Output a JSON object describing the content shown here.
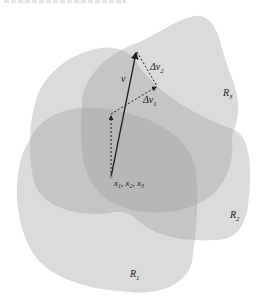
{
  "figure": {
    "type": "region-overlap-vector-diagram",
    "colors": {
      "background": "#ffffff",
      "region_fill": "#9a9a9a",
      "region_opacity": 0.38,
      "line": "#222222"
    },
    "regions": [
      {
        "id": "R1",
        "label": "R",
        "subscript": "1"
      },
      {
        "id": "R2",
        "label": "R",
        "subscript": "2"
      },
      {
        "id": "R3",
        "label": "R",
        "subscript": "3"
      }
    ],
    "vectors": {
      "v": {
        "label": "v"
      },
      "delta_v1": {
        "label": "Δv",
        "subscript": "1"
      },
      "delta_v2": {
        "label": "Δv",
        "subscript": "2"
      }
    },
    "origin": {
      "label_parts": [
        {
          "base": "x",
          "sub": "1"
        },
        {
          "base": "x",
          "sub": "2"
        },
        {
          "base": "x",
          "sub": "3"
        }
      ],
      "separator": ", "
    }
  }
}
